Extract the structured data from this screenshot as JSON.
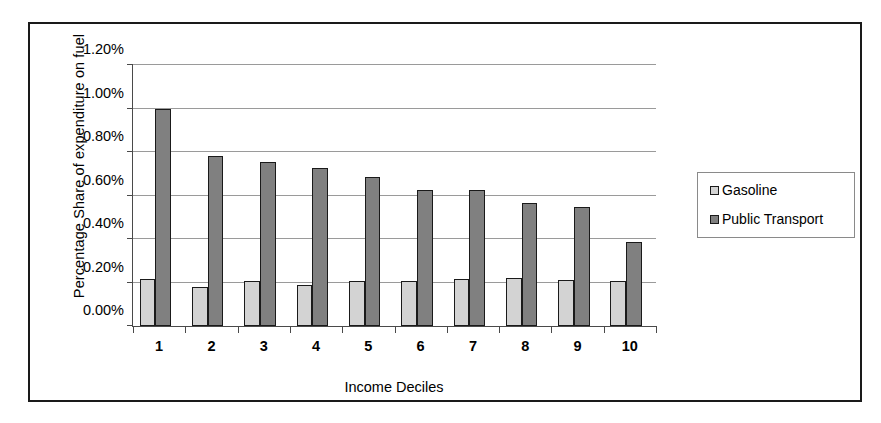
{
  "chart_data": {
    "type": "bar",
    "title": "",
    "xlabel": "Income Deciles",
    "ylabel": "Percentage Share of expenditure on fuel",
    "categories": [
      "1",
      "2",
      "3",
      "4",
      "5",
      "6",
      "7",
      "8",
      "9",
      "10"
    ],
    "series": [
      {
        "name": "Gasoline",
        "color": "#d3d3d3",
        "values": [
          0.215,
          0.18,
          0.205,
          0.19,
          0.205,
          0.205,
          0.215,
          0.22,
          0.21,
          0.205
        ]
      },
      {
        "name": "Public Transport",
        "color": "#808080",
        "values": [
          1.0,
          0.78,
          0.755,
          0.725,
          0.685,
          0.625,
          0.625,
          0.565,
          0.545,
          0.385
        ]
      }
    ],
    "ylim": [
      0.0,
      1.2
    ],
    "ytick_labels": [
      "0.00%",
      "0.20%",
      "0.40%",
      "0.60%",
      "0.80%",
      "1.00%",
      "1.20%"
    ],
    "ytick_values": [
      0.0,
      0.2,
      0.4,
      0.6,
      0.8,
      1.0,
      1.2
    ],
    "grid": true,
    "legend_position": "right",
    "legend": [
      "Gasoline",
      "Public Transport"
    ]
  },
  "legend": {
    "entries": [
      {
        "label": "Gasoline",
        "swatch": "legend-swatch-gasoline"
      },
      {
        "label": "Public Transport",
        "swatch": "legend-swatch-public-transport"
      }
    ]
  }
}
